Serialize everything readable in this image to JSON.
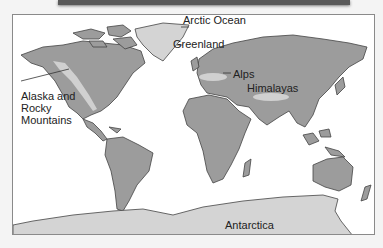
{
  "figure": {
    "type": "world-map",
    "colors": {
      "background": "#f4f4f4",
      "ocean": "#ffffff",
      "land": "#9c9c9c",
      "ice": "#d4d4d4",
      "mountains": "#d0d0d0",
      "coastline": "#444444",
      "frame_border": "#8a8a8a"
    },
    "labels": {
      "arctic_ocean": "Arctic Ocean",
      "greenland": "Greenland",
      "alaska_rocky": [
        "Alaska and",
        "Rocky",
        "Mountains"
      ],
      "alps": "Alps",
      "himalayas": "Himalayas",
      "antarctica": "Antarctica"
    }
  }
}
